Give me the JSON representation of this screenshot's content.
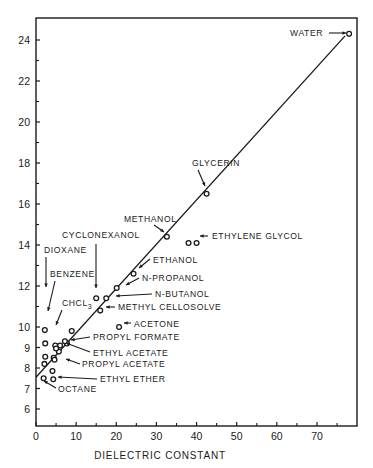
{
  "chart_data": {
    "type": "scatter",
    "title": "",
    "xlabel": "DIELECTRIC CONSTANT",
    "ylabel": "",
    "xlim": [
      0,
      80
    ],
    "ylim": [
      5.2,
      25
    ],
    "grid": false,
    "legend": null,
    "x_ticks": [
      0,
      10,
      20,
      30,
      40,
      50,
      60,
      70
    ],
    "x_minor_ticks": [
      5,
      15,
      25,
      35,
      45,
      55,
      65,
      75
    ],
    "y_ticks": [
      6,
      7,
      8,
      9,
      10,
      12,
      14,
      16,
      18,
      20,
      22,
      24
    ],
    "y_minor_ticks": [
      11,
      13,
      15,
      17,
      19,
      21,
      23
    ],
    "y_tick_labels": [
      "6",
      "7",
      "8",
      "9",
      "10",
      "12",
      "14",
      "16",
      "18",
      "20",
      "22",
      "24"
    ],
    "x_tick_labels": [
      "0",
      "10",
      "20",
      "30",
      "40",
      "50",
      "60",
      "70"
    ],
    "fit_line": {
      "x0": 0,
      "y0": 7.55,
      "x1": 77,
      "y1": 24.2
    },
    "points": [
      {
        "name": "WATER",
        "x": 78.0,
        "y": 24.3,
        "label_side": "left"
      },
      {
        "name": "GLYCERIN",
        "x": 42.5,
        "y": 16.5,
        "label_side": "above"
      },
      {
        "name": "METHANOL",
        "x": 32.6,
        "y": 14.4,
        "label_side": "above-left"
      },
      {
        "name": "ETHYLENE GLYCOL",
        "x": 38.0,
        "y": 14.1,
        "label_side": "right"
      },
      {
        "name": "ETHYLENE GLYCOL (2)",
        "x": 40.0,
        "y": 14.1,
        "label_side": "none"
      },
      {
        "name": "ETHANOL",
        "x": 24.3,
        "y": 12.6,
        "label_side": "right"
      },
      {
        "name": "N-PROPANOL",
        "x": 20.1,
        "y": 11.9,
        "label_side": "right"
      },
      {
        "name": "N-BUTANOL",
        "x": 17.5,
        "y": 11.4,
        "label_side": "right"
      },
      {
        "name": "CYCLONEXANOL",
        "x": 15.0,
        "y": 11.4,
        "label_side": "above"
      },
      {
        "name": "METHYL CELLOSOLVE",
        "x": 16.0,
        "y": 10.8,
        "label_side": "right"
      },
      {
        "name": "ACETONE",
        "x": 20.7,
        "y": 10.0,
        "label_side": "right"
      },
      {
        "name": "DIOXANE",
        "x": 2.2,
        "y": 9.85,
        "label_side": "above"
      },
      {
        "name": "BENZENE",
        "x": 2.3,
        "y": 9.2,
        "label_side": "above"
      },
      {
        "name": "CHCL3",
        "x": 4.8,
        "y": 9.1,
        "label_side": "above"
      },
      {
        "name": "PROPYL FORMATE",
        "x": 7.7,
        "y": 9.2,
        "label_side": "right"
      },
      {
        "name": "ETHYL ACETATE",
        "x": 6.0,
        "y": 9.1,
        "label_side": "right"
      },
      {
        "name": "PROPYL ACETATE",
        "x": 5.7,
        "y": 8.8,
        "label_side": "right"
      },
      {
        "name": "ETHYL ETHER",
        "x": 4.3,
        "y": 7.45,
        "label_side": "right"
      },
      {
        "name": "OCTANE",
        "x": 1.9,
        "y": 7.5,
        "label_side": "below"
      },
      {
        "name": "UNLABELED-1",
        "x": 8.9,
        "y": 9.8,
        "label_side": "none"
      },
      {
        "name": "UNLABELED-2",
        "x": 7.2,
        "y": 9.3,
        "label_side": "none"
      },
      {
        "name": "UNLABELED-3",
        "x": 5.0,
        "y": 8.95,
        "label_side": "none"
      },
      {
        "name": "UNLABELED-4",
        "x": 4.4,
        "y": 8.5,
        "label_side": "none"
      },
      {
        "name": "UNLABELED-5",
        "x": 4.6,
        "y": 8.4,
        "label_side": "none"
      },
      {
        "name": "UNLABELED-6",
        "x": 2.3,
        "y": 8.55,
        "label_side": "none"
      },
      {
        "name": "UNLABELED-7",
        "x": 2.1,
        "y": 8.2,
        "label_side": "none"
      },
      {
        "name": "UNLABELED-8",
        "x": 4.1,
        "y": 7.85,
        "label_side": "none"
      }
    ],
    "annotations": [
      {
        "text": "WATER",
        "x": 290,
        "y": 36,
        "anchor": "start"
      },
      {
        "text": "GLYCERIN",
        "x": 192,
        "y": 166,
        "anchor": "start"
      },
      {
        "text": "METHANOL",
        "x": 124,
        "y": 222,
        "anchor": "start"
      },
      {
        "text": "ETHYLENE GLYCOL",
        "x": 212,
        "y": 239,
        "anchor": "start"
      },
      {
        "text": "CYCLONEXANOL",
        "x": 62,
        "y": 238,
        "anchor": "start"
      },
      {
        "text": "DIOXANE",
        "x": 44,
        "y": 253,
        "anchor": "start"
      },
      {
        "text": "ETHANOL",
        "x": 153,
        "y": 263,
        "anchor": "start"
      },
      {
        "text": "BENZENE",
        "x": 50,
        "y": 277,
        "anchor": "start"
      },
      {
        "text": "N-PROPANOL",
        "x": 142,
        "y": 281,
        "anchor": "start"
      },
      {
        "text": "N-BUTANOL",
        "x": 155,
        "y": 297,
        "anchor": "start"
      },
      {
        "text": "CHCL",
        "sub": "3",
        "x": 62,
        "y": 306,
        "anchor": "start"
      },
      {
        "text": "METHYL CELLOSOLVE",
        "x": 118,
        "y": 310,
        "anchor": "start"
      },
      {
        "text": "ACETONE",
        "x": 134,
        "y": 327,
        "anchor": "start"
      },
      {
        "text": "PROPYL FORMATE",
        "x": 93,
        "y": 340,
        "anchor": "start"
      },
      {
        "text": "ETHYL ACETATE",
        "x": 93,
        "y": 356,
        "anchor": "start"
      },
      {
        "text": "PROPYL ACETATE",
        "x": 82,
        "y": 367,
        "anchor": "start"
      },
      {
        "text": "ETHYL ETHER",
        "x": 100,
        "y": 382,
        "anchor": "start"
      },
      {
        "text": "OCTANE",
        "x": 58,
        "y": 392,
        "anchor": "start"
      }
    ]
  },
  "axes": {
    "x_title": "DIELECTRIC CONSTANT"
  }
}
